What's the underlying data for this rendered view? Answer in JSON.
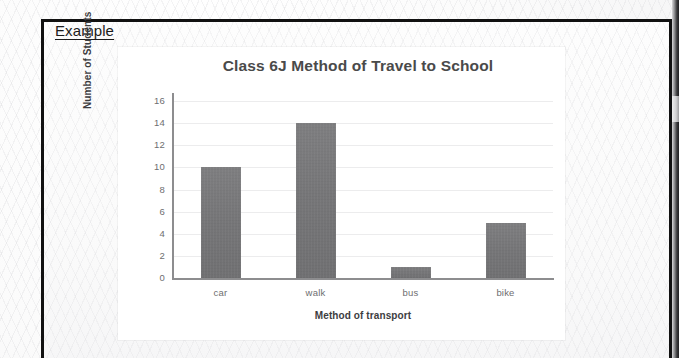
{
  "worksheet": {
    "heading": "Example"
  },
  "chart_data": {
    "type": "bar",
    "title": "Class 6J Method of Travel to School",
    "xlabel": "Method of transport",
    "ylabel": "Number of Students",
    "categories": [
      "car",
      "walk",
      "bus",
      "bike"
    ],
    "values": [
      10,
      14,
      1,
      5
    ],
    "ylim": [
      0,
      16
    ],
    "ytick_step": 2,
    "yticks": [
      0,
      2,
      4,
      6,
      8,
      10,
      12,
      14,
      16
    ],
    "ytick_labels": [
      "0",
      "2",
      "4",
      "6",
      "8",
      "10",
      "12",
      "14",
      "16"
    ],
    "grid": true,
    "legend": false,
    "bar_color": "#767678",
    "axis_color": "#8d8d8f",
    "gridline_color": "#ececed",
    "title_color": "#4a4a4a",
    "plot_background": "#ffffff"
  }
}
